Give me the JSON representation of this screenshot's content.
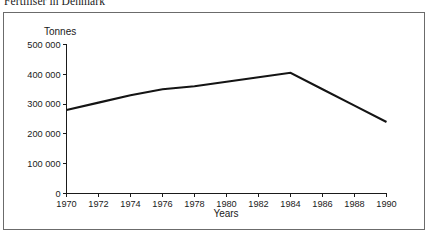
{
  "caption": {
    "text": "Fertiliser in Denmark"
  },
  "chart_data": {
    "type": "line",
    "title": "",
    "xlabel": "Years",
    "ylabel": "Tonnes",
    "xlim": [
      1970,
      1990
    ],
    "ylim": [
      0,
      500000
    ],
    "grid": false,
    "legend": null,
    "x_ticks": [
      "1970",
      "1972",
      "1974",
      "1976",
      "1978",
      "1980",
      "1982",
      "1984",
      "1986",
      "1988",
      "1990"
    ],
    "y_ticks": [
      "0",
      "100 000",
      "200 000",
      "300 000",
      "400 000",
      "500 000"
    ],
    "line_color": "#141414",
    "series": [
      {
        "name": "Fertiliser consumption",
        "x": [
          1970,
          1972,
          1974,
          1976,
          1978,
          1980,
          1982,
          1984,
          1986,
          1988,
          1990
        ],
        "values": [
          280000,
          305000,
          330000,
          350000,
          360000,
          375000,
          390000,
          405000,
          350000,
          295000,
          240000
        ]
      }
    ]
  }
}
